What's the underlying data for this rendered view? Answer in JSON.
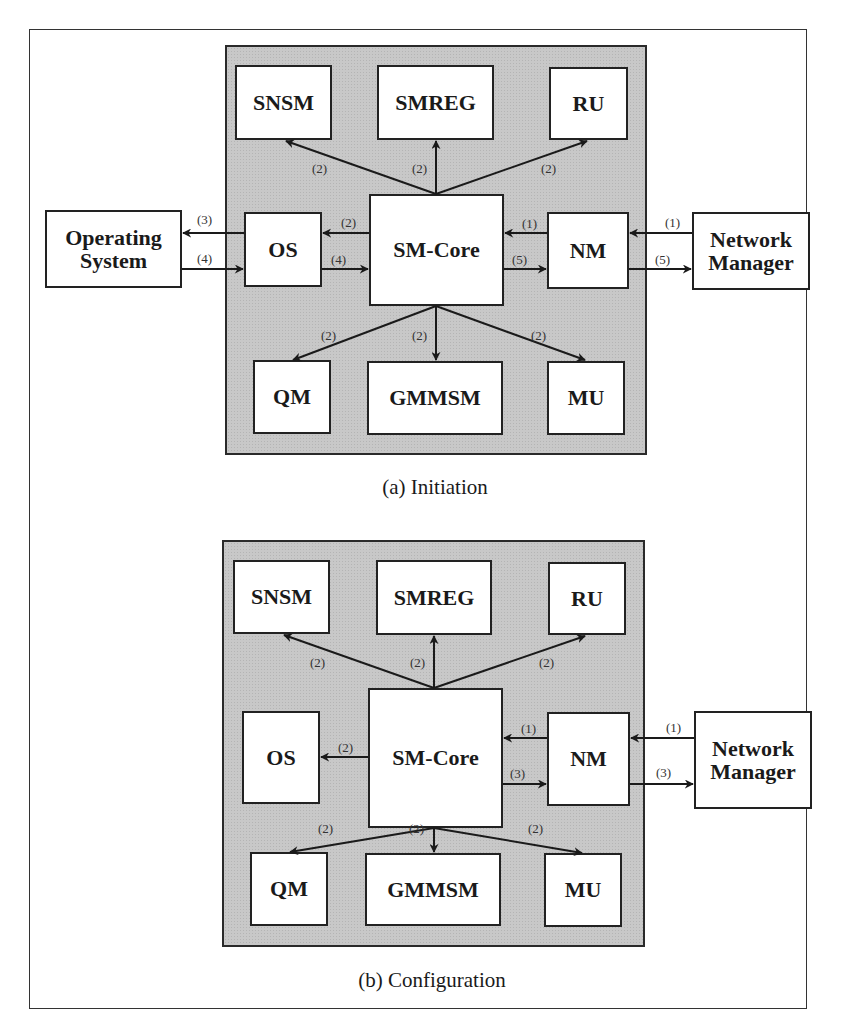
{
  "panels": [
    {
      "caption": "(a) Initiation",
      "modules": {
        "snsm": "SNSM",
        "smreg": "SMREG",
        "ru": "RU",
        "core": "SM-Core",
        "os": "OS",
        "nm": "NM",
        "qm": "QM",
        "gmmsm": "GMMSM",
        "mu": "MU"
      },
      "external": {
        "operating_system": "Operating System",
        "network_manager": "Network Manager"
      },
      "edges": [
        {
          "from": "Network Manager",
          "to": "NM",
          "label": "(1)"
        },
        {
          "from": "NM",
          "to": "SM-Core",
          "label": "(1)"
        },
        {
          "from": "SM-Core",
          "to": "SNSM",
          "label": "(2)"
        },
        {
          "from": "SM-Core",
          "to": "SMREG",
          "label": "(2)"
        },
        {
          "from": "SM-Core",
          "to": "RU",
          "label": "(2)"
        },
        {
          "from": "SM-Core",
          "to": "OS",
          "label": "(2)"
        },
        {
          "from": "SM-Core",
          "to": "QM",
          "label": "(2)"
        },
        {
          "from": "SM-Core",
          "to": "GMMSM",
          "label": "(2)"
        },
        {
          "from": "SM-Core",
          "to": "MU",
          "label": "(2)"
        },
        {
          "from": "OS",
          "to": "Operating System",
          "label": "(3)"
        },
        {
          "from": "Operating System",
          "to": "OS",
          "label": "(4)"
        },
        {
          "from": "OS",
          "to": "SM-Core",
          "label": "(4)"
        },
        {
          "from": "SM-Core",
          "to": "NM",
          "label": "(5)"
        },
        {
          "from": "NM",
          "to": "Network Manager",
          "label": "(5)"
        }
      ],
      "labels": {
        "snsm": "(2)",
        "smreg": "(2)",
        "ru": "(2)",
        "os_to_opsys": "(3)",
        "opsys_to_os": "(4)",
        "core_to_os": "(2)",
        "os_to_core": "(4)",
        "nm_to_core": "(1)",
        "core_to_nm": "(5)",
        "netmgr_to_nm": "(1)",
        "nm_to_netmgr": "(5)",
        "qm": "(2)",
        "gmmsm": "(2)",
        "mu": "(2)"
      }
    },
    {
      "caption": "(b) Configuration",
      "modules": {
        "snsm": "SNSM",
        "smreg": "SMREG",
        "ru": "RU",
        "core": "SM-Core",
        "os": "OS",
        "nm": "NM",
        "qm": "QM",
        "gmmsm": "GMMSM",
        "mu": "MU"
      },
      "external": {
        "network_manager": "Network Manager"
      },
      "edges": [
        {
          "from": "Network Manager",
          "to": "NM",
          "label": "(1)"
        },
        {
          "from": "NM",
          "to": "SM-Core",
          "label": "(1)"
        },
        {
          "from": "SM-Core",
          "to": "SNSM",
          "label": "(2)"
        },
        {
          "from": "SM-Core",
          "to": "SMREG",
          "label": "(2)"
        },
        {
          "from": "SM-Core",
          "to": "RU",
          "label": "(2)"
        },
        {
          "from": "SM-Core",
          "to": "OS",
          "label": "(2)"
        },
        {
          "from": "SM-Core",
          "to": "QM",
          "label": "(2)"
        },
        {
          "from": "SM-Core",
          "to": "GMMSM",
          "label": "(2)"
        },
        {
          "from": "SM-Core",
          "to": "MU",
          "label": "(2)"
        },
        {
          "from": "SM-Core",
          "to": "NM",
          "label": "(3)"
        },
        {
          "from": "NM",
          "to": "Network Manager",
          "label": "(3)"
        }
      ],
      "labels": {
        "snsm": "(2)",
        "smreg": "(2)",
        "ru": "(2)",
        "core_to_os": "(2)",
        "nm_to_core": "(1)",
        "core_to_nm": "(3)",
        "netmgr_to_nm": "(1)",
        "nm_to_netmgr": "(3)",
        "qm": "(2)",
        "gmmsm": "(2)",
        "mu": "(2)"
      }
    }
  ]
}
